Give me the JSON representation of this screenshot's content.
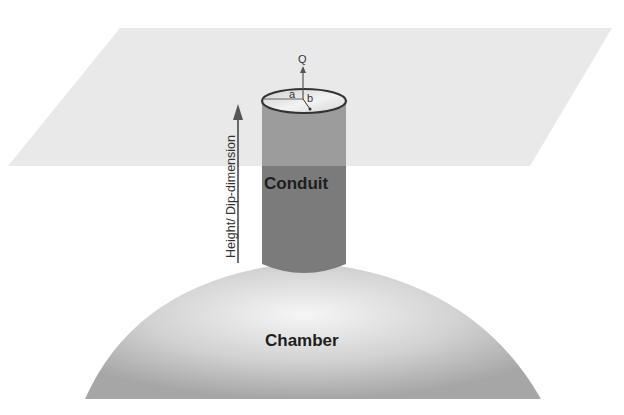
{
  "diagram": {
    "labels": {
      "conduit": "Conduit",
      "chamber": "Chamber",
      "flux": "Q",
      "semi_axis_a": "a",
      "semi_axis_b": "b",
      "height_axis": "Height/ Dip-dimension"
    },
    "colors": {
      "plane": "#ececec",
      "conduit_above": "#9c9c9c",
      "conduit_below": "#7b7b7b",
      "chamber_light": "#f4f4f4",
      "chamber_dark": "#a8a8a8",
      "lines": "#444444"
    }
  }
}
